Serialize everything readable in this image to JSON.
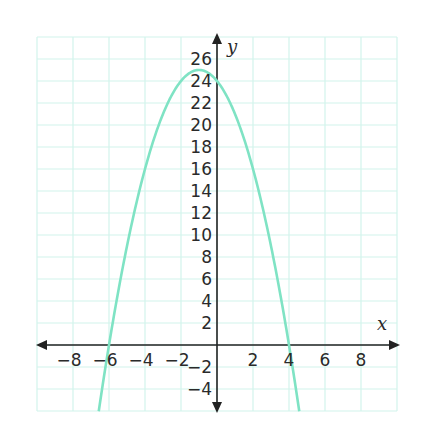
{
  "chart_data": {
    "type": "line",
    "title": "",
    "xlabel": "x",
    "ylabel": "y",
    "xlim": [
      -10,
      10
    ],
    "ylim": [
      -6,
      28
    ],
    "grid": true,
    "x_ticks": [
      -8,
      -6,
      -4,
      -2,
      2,
      4,
      6,
      8
    ],
    "y_ticks": [
      -4,
      -2,
      2,
      4,
      6,
      8,
      10,
      12,
      14,
      16,
      18,
      20,
      22,
      24,
      26
    ],
    "x_tick_labels": [
      "−8",
      "−6",
      "−4",
      "−2",
      "2",
      "4",
      "6",
      "8"
    ],
    "y_tick_labels": [
      "−4",
      "−2",
      "2",
      "4",
      "6",
      "8",
      "10",
      "12",
      "14",
      "16",
      "18",
      "20",
      "22",
      "24",
      "26"
    ],
    "series": [
      {
        "name": "parabola",
        "equation": "y = -x^2 - 2x + 24",
        "color": "#7fe3c4",
        "x_intercepts": [
          -6,
          4
        ],
        "y_intercept": 24,
        "vertex": [
          -1,
          25
        ],
        "x": [
          -6.57,
          -6,
          -5,
          -4,
          -3,
          -2,
          -1,
          0,
          1,
          2,
          3,
          4,
          4.57
        ],
        "y": [
          -6,
          0,
          9,
          16,
          21,
          24,
          25,
          24,
          21,
          16,
          9,
          0,
          -6
        ]
      }
    ]
  },
  "labels": {
    "x_axis": "x",
    "y_axis": "y"
  },
  "colors": {
    "curve": "#7fe3c4",
    "grid": "#d2f3ec",
    "axis": "#222222"
  }
}
